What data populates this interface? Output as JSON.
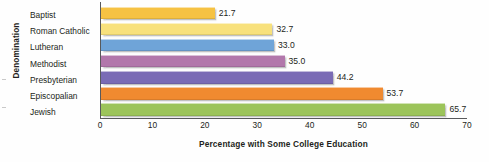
{
  "chart_data": {
    "type": "bar",
    "orientation": "horizontal",
    "title": "",
    "xlabel": "Percentage with Some College Education",
    "ylabel": "Denomination",
    "categories": [
      "Baptist",
      "Roman Catholic",
      "Lutheran",
      "Methodist",
      "Presbyterian",
      "Episcopalian",
      "Jewish"
    ],
    "values": [
      21.7,
      32.7,
      33.0,
      35.0,
      44.2,
      53.7,
      65.7
    ],
    "value_labels": [
      "21.7",
      "32.7",
      "33.0",
      "35.0",
      "44.2",
      "53.7",
      "65.7"
    ],
    "xlim": [
      0,
      70
    ],
    "xticks": [
      0,
      10,
      20,
      30,
      40,
      50,
      60,
      70
    ],
    "xtick_labels": [
      "0",
      "10",
      "20",
      "30",
      "40",
      "50",
      "60",
      "70"
    ],
    "grid": false,
    "legend": "none",
    "colors": [
      "#f6c243",
      "#f8e17c",
      "#6fa4d8",
      "#b277ab",
      "#7a6bb5",
      "#f08a30",
      "#9cc45a"
    ]
  }
}
